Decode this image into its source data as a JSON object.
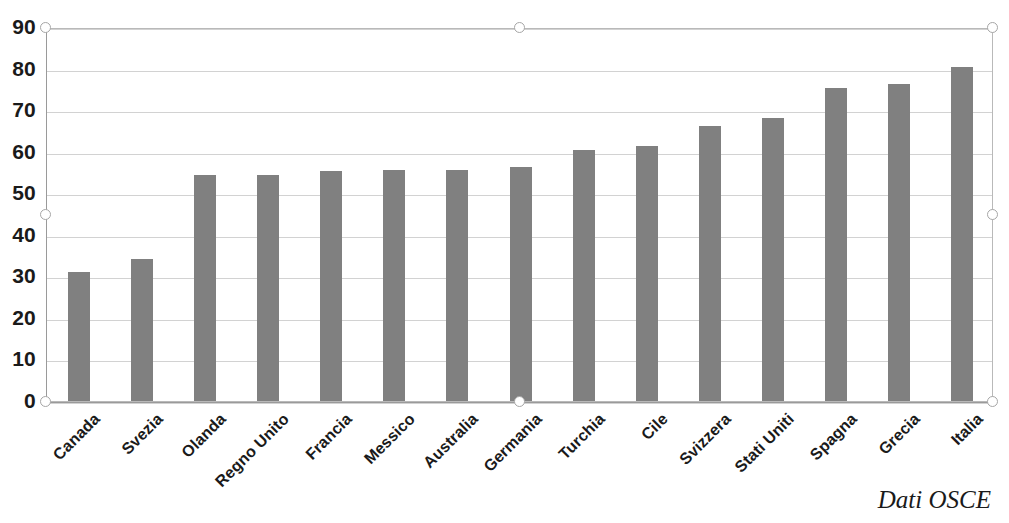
{
  "chart_data": {
    "type": "bar",
    "title": "",
    "subtitle": "",
    "xlabel": "",
    "ylabel": "",
    "categories": [
      "Canada",
      "Svezia",
      "Olanda",
      "Regno Unito",
      "Francia",
      "Messico",
      "Australia",
      "Germania",
      "Turchia",
      "Cile",
      "Svizzera",
      "Stati Uniti",
      "Spagna",
      "Grecia",
      "Italia"
    ],
    "values": [
      31.1,
      34.1,
      54.3,
      54.3,
      55.4,
      55.5,
      55.6,
      56.4,
      60.4,
      61.3,
      66.3,
      68.2,
      75.4,
      76.4,
      80.4
    ],
    "ylim": [
      0,
      90
    ],
    "ytick_values": [
      0,
      10,
      20,
      30,
      40,
      50,
      60,
      70,
      80,
      90
    ],
    "ytick_labels": [
      "0",
      "10",
      "20",
      "30",
      "40",
      "50",
      "60",
      "70",
      "80",
      "90"
    ],
    "ytick_step": 10,
    "grid": true,
    "grid_axis": "y",
    "legend": false,
    "legend_position": "none",
    "bar_color": "#808080",
    "gridline_color": "#d2d2d2",
    "axis_color": "#9a9a9a",
    "plot_background": "#ffffff",
    "annotations": [
      {
        "name": "source-note",
        "text": "Dati OSCE",
        "position": "bottom-right"
      }
    ]
  },
  "source": {
    "label": "Dati OSCE"
  },
  "selection": {
    "active": true,
    "handle_count": 8
  }
}
